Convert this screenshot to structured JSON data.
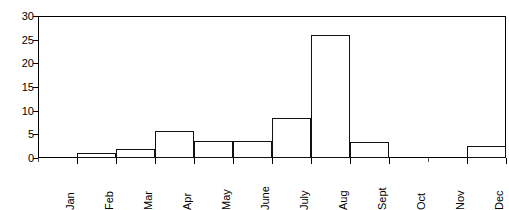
{
  "chart_data": {
    "type": "bar",
    "title": "",
    "subtitle": "",
    "xlabel": "",
    "ylabel": "",
    "categories": [
      "Jan",
      "Feb",
      "Mar",
      "Apr",
      "May",
      "June",
      "July",
      "Aug",
      "Sept",
      "Oct",
      "Nov",
      "Dec"
    ],
    "values": [
      0,
      1,
      2,
      5.8,
      3.5,
      3.5,
      8.5,
      26,
      3.4,
      0,
      0,
      2.5
    ],
    "ylim": [
      0,
      30
    ],
    "yticks": [
      0,
      5,
      10,
      15,
      20,
      25,
      30
    ],
    "ytick_labels": [
      "0",
      "5",
      "10",
      "15",
      "20",
      "25",
      "30"
    ],
    "grid": false,
    "legend": false,
    "legend_position": "none",
    "bar_style": "contiguous-histogram",
    "bar_fill_color": "#ffffff",
    "bar_edge_color": "#111111",
    "axis_color": "#000000",
    "background_color": "#ffffff",
    "xtick_label_rotation": 90
  }
}
